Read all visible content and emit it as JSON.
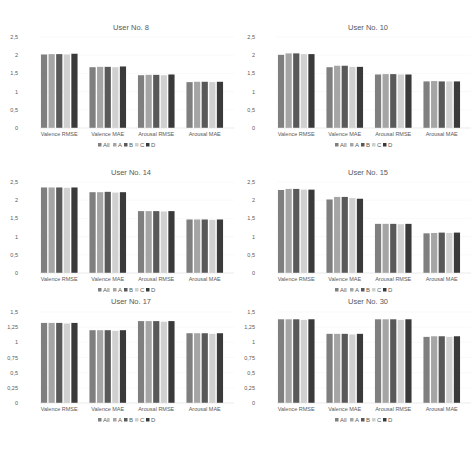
{
  "chart_data": [
    {
      "type": "bar",
      "title": "User No. 8",
      "categories": [
        "Valence RMSE",
        "Valence MAE",
        "Arousal RMSE",
        "Arousal MAE"
      ],
      "ylim": [
        0,
        2.5
      ],
      "yticks": [
        "0",
        "0,5",
        "1",
        "1,5",
        "2",
        "2,5"
      ],
      "ytick_values": [
        0,
        0.5,
        1,
        1.5,
        2,
        2.5
      ],
      "legend": "bottom",
      "series": [
        {
          "name": "All",
          "color": "#7f7f7f",
          "values": [
            2.02,
            1.67,
            1.45,
            1.26
          ]
        },
        {
          "name": "A",
          "color": "#a5a5a5",
          "values": [
            2.03,
            1.68,
            1.46,
            1.27
          ]
        },
        {
          "name": "B",
          "color": "#595959",
          "values": [
            2.03,
            1.68,
            1.46,
            1.27
          ]
        },
        {
          "name": "C",
          "color": "#d0d0d0",
          "values": [
            2.02,
            1.67,
            1.45,
            1.26
          ]
        },
        {
          "name": "D",
          "color": "#3a3a3a",
          "values": [
            2.04,
            1.69,
            1.47,
            1.27
          ]
        }
      ]
    },
    {
      "type": "bar",
      "title": "User No. 10",
      "categories": [
        "Valence RMSE",
        "Valence MAE",
        "Arousal RMSE",
        "Arousal MAE"
      ],
      "ylim": [
        0,
        2.5
      ],
      "yticks": [
        "0",
        "0,5",
        "1",
        "1,5",
        "2",
        "2,5"
      ],
      "ytick_values": [
        0,
        0.5,
        1,
        1.5,
        2,
        2.5
      ],
      "legend": "bottom",
      "series": [
        {
          "name": "All",
          "color": "#7f7f7f",
          "values": [
            2.01,
            1.67,
            1.47,
            1.28
          ]
        },
        {
          "name": "A",
          "color": "#a5a5a5",
          "values": [
            2.05,
            1.71,
            1.48,
            1.29
          ]
        },
        {
          "name": "B",
          "color": "#595959",
          "values": [
            2.05,
            1.71,
            1.48,
            1.28
          ]
        },
        {
          "name": "C",
          "color": "#d0d0d0",
          "values": [
            2.03,
            1.68,
            1.47,
            1.28
          ]
        },
        {
          "name": "D",
          "color": "#3a3a3a",
          "values": [
            2.03,
            1.68,
            1.47,
            1.28
          ]
        }
      ]
    },
    {
      "type": "bar",
      "title": "User No. 14",
      "categories": [
        "Valence RMSE",
        "Valence MAE",
        "Arousal RMSE",
        "Arousal MAE"
      ],
      "ylim": [
        0,
        2.5
      ],
      "yticks": [
        "0",
        "0,5",
        "1",
        "1,5",
        "2",
        "2,5"
      ],
      "ytick_values": [
        0,
        0.5,
        1,
        1.5,
        2,
        2.5
      ],
      "legend": "bottom",
      "series": [
        {
          "name": "All",
          "color": "#7f7f7f",
          "values": [
            2.35,
            2.22,
            1.7,
            1.47
          ]
        },
        {
          "name": "A",
          "color": "#a5a5a5",
          "values": [
            2.35,
            2.22,
            1.7,
            1.47
          ]
        },
        {
          "name": "B",
          "color": "#595959",
          "values": [
            2.35,
            2.23,
            1.7,
            1.47
          ]
        },
        {
          "name": "C",
          "color": "#d0d0d0",
          "values": [
            2.34,
            2.21,
            1.69,
            1.46
          ]
        },
        {
          "name": "D",
          "color": "#3a3a3a",
          "values": [
            2.35,
            2.22,
            1.7,
            1.47
          ]
        }
      ]
    },
    {
      "type": "bar",
      "title": "User No. 15",
      "categories": [
        "Valence RMSE",
        "Valence MAE",
        "Arousal RMSE",
        "Arousal MAE"
      ],
      "ylim": [
        0,
        2.5
      ],
      "yticks": [
        "0",
        "0,5",
        "1",
        "1,5",
        "2",
        "2,5"
      ],
      "ytick_values": [
        0,
        0.5,
        1,
        1.5,
        2,
        2.5
      ],
      "legend": "bottom",
      "series": [
        {
          "name": "All",
          "color": "#7f7f7f",
          "values": [
            2.28,
            2.02,
            1.35,
            1.09
          ]
        },
        {
          "name": "A",
          "color": "#a5a5a5",
          "values": [
            2.31,
            2.09,
            1.35,
            1.1
          ]
        },
        {
          "name": "B",
          "color": "#595959",
          "values": [
            2.31,
            2.09,
            1.35,
            1.11
          ]
        },
        {
          "name": "C",
          "color": "#d0d0d0",
          "values": [
            2.29,
            2.06,
            1.34,
            1.1
          ]
        },
        {
          "name": "D",
          "color": "#3a3a3a",
          "values": [
            2.29,
            2.04,
            1.35,
            1.11
          ]
        }
      ]
    },
    {
      "type": "bar",
      "title": "User No. 17",
      "categories": [
        "Valence RMSE",
        "Valence MAE",
        "Arousal RMSE",
        "Arousal MAE"
      ],
      "ylim": [
        0,
        1.5
      ],
      "yticks": [
        "0",
        "0,25",
        "0,5",
        "0,75",
        "1",
        "1,25",
        "1,5"
      ],
      "ytick_values": [
        0,
        0.25,
        0.5,
        0.75,
        1,
        1.25,
        1.5
      ],
      "legend": "bottom",
      "series": [
        {
          "name": "All",
          "color": "#7f7f7f",
          "values": [
            1.32,
            1.2,
            1.35,
            1.15
          ]
        },
        {
          "name": "A",
          "color": "#a5a5a5",
          "values": [
            1.32,
            1.2,
            1.35,
            1.15
          ]
        },
        {
          "name": "B",
          "color": "#595959",
          "values": [
            1.32,
            1.2,
            1.35,
            1.15
          ]
        },
        {
          "name": "C",
          "color": "#d0d0d0",
          "values": [
            1.31,
            1.19,
            1.34,
            1.14
          ]
        },
        {
          "name": "D",
          "color": "#3a3a3a",
          "values": [
            1.32,
            1.2,
            1.35,
            1.15
          ]
        }
      ]
    },
    {
      "type": "bar",
      "title": "User No. 30",
      "categories": [
        "Valence RMSE",
        "Valence MAE",
        "Arousal RMSE",
        "Arousal MAE"
      ],
      "ylim": [
        0,
        1.5
      ],
      "yticks": [
        "0",
        "0,25",
        "0,5",
        "0,75",
        "1",
        "1,25",
        "1,5"
      ],
      "ytick_values": [
        0,
        0.25,
        0.5,
        0.75,
        1,
        1.25,
        1.5
      ],
      "legend": "bottom",
      "series": [
        {
          "name": "All",
          "color": "#7f7f7f",
          "values": [
            1.38,
            1.14,
            1.38,
            1.09
          ]
        },
        {
          "name": "A",
          "color": "#a5a5a5",
          "values": [
            1.38,
            1.14,
            1.38,
            1.1
          ]
        },
        {
          "name": "B",
          "color": "#595959",
          "values": [
            1.38,
            1.14,
            1.38,
            1.1
          ]
        },
        {
          "name": "C",
          "color": "#d0d0d0",
          "values": [
            1.37,
            1.13,
            1.37,
            1.09
          ]
        },
        {
          "name": "D",
          "color": "#3a3a3a",
          "values": [
            1.38,
            1.14,
            1.38,
            1.1
          ]
        }
      ]
    }
  ]
}
